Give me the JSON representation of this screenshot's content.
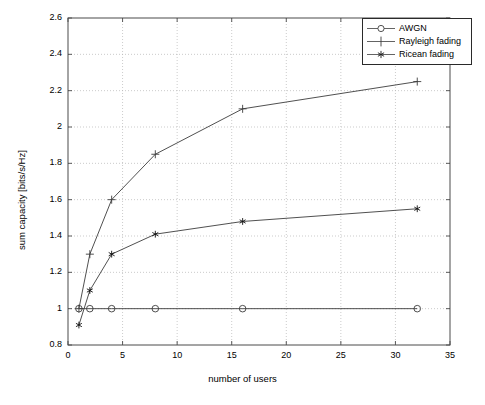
{
  "chart_data": {
    "type": "line",
    "title": "",
    "xlabel": "number of users",
    "ylabel": "sum capacity [bits/s/Hz]",
    "xlim": [
      0,
      35
    ],
    "ylim": [
      0.8,
      2.6
    ],
    "xticks": [
      0,
      5,
      10,
      15,
      20,
      25,
      30,
      35
    ],
    "xtick_labels": [
      "0",
      "5",
      "10",
      "15",
      "20",
      "25",
      "30",
      "35"
    ],
    "yticks": [
      0.8,
      1.0,
      1.2,
      1.4,
      1.6,
      1.8,
      2.0,
      2.2,
      2.4,
      2.6
    ],
    "ytick_labels": [
      "0.8",
      "1",
      "1.2",
      "1.4",
      "1.6",
      "1.8",
      "2",
      "2.2",
      "2.4",
      "2.6"
    ],
    "grid": true,
    "grid_style": "dotted",
    "legend_position": "top-right",
    "x": [
      1,
      2,
      4,
      8,
      16,
      32
    ],
    "series": [
      {
        "name": "AWGN",
        "marker": "circle",
        "color": "#3c3c3c",
        "values": [
          1.0,
          1.0,
          1.0,
          1.0,
          1.0,
          1.0
        ]
      },
      {
        "name": "Rayleigh fading",
        "marker": "plus",
        "color": "#3c3c3c",
        "values": [
          1.0,
          1.3,
          1.6,
          1.85,
          2.1,
          2.25
        ]
      },
      {
        "name": "Ricean fading",
        "marker": "star",
        "color": "#3c3c3c",
        "values": [
          0.91,
          1.1,
          1.3,
          1.41,
          1.48,
          1.55
        ]
      }
    ]
  },
  "legend": {
    "items": [
      {
        "label": "AWGN",
        "marker": "circle-marker"
      },
      {
        "label": "Rayleigh fading",
        "marker": "plus-marker"
      },
      {
        "label": "Ricean fading",
        "marker": "star-marker"
      }
    ]
  },
  "axes": {
    "x_axis_label": "number of users",
    "y_axis_label": "sum capacity [bits/s/Hz]"
  }
}
